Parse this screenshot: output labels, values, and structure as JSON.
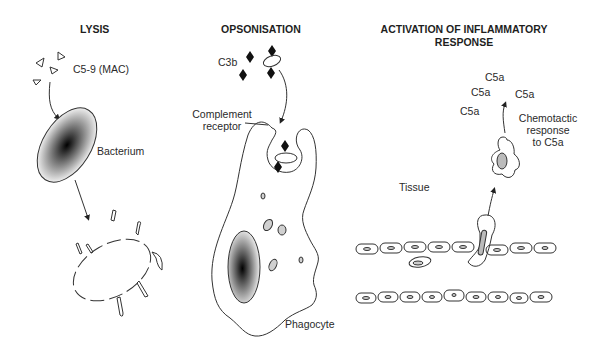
{
  "panels": {
    "lysis": {
      "title": "LYSIS",
      "labels": {
        "mac": "C5-9 (MAC)",
        "bacterium": "Bacterium"
      }
    },
    "opsonisation": {
      "title": "OPSONISATION",
      "labels": {
        "c3b": "C3b",
        "receptor_line1": "Complement",
        "receptor_line2": "receptor",
        "phagocyte": "Phagocyte"
      }
    },
    "inflammation": {
      "title_line1": "ACTIVATION OF INFLAMMATORY",
      "title_line2": "RESPONSE",
      "labels": {
        "c5a_items": [
          "C5a",
          "C5a",
          "C5a",
          "C5a"
        ],
        "chemotactic_line1": "Chemotactic",
        "chemotactic_line2": "response",
        "chemotactic_line3": "to C5a",
        "tissue": "Tissue"
      }
    }
  },
  "colors": {
    "stroke": "#333333",
    "text": "#2a2a2a",
    "fill_gray": "#c8c8c8",
    "nucleus_dark": "#000000"
  }
}
